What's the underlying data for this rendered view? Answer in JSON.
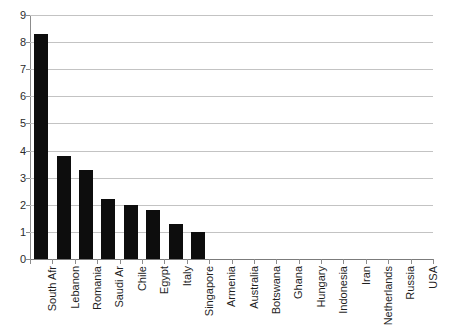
{
  "chart_data": {
    "type": "bar",
    "title": "",
    "subtitle": "",
    "xlabel": "",
    "ylabel": "",
    "ylim": [
      0,
      9
    ],
    "yticks": [
      0,
      1,
      2,
      3,
      4,
      5,
      6,
      7,
      8,
      9
    ],
    "ytick_labels": [
      "0",
      "1",
      "2",
      "3",
      "4",
      "5",
      "6",
      "7",
      "8",
      "9"
    ],
    "grid": true,
    "legend": null,
    "legend_position": "none",
    "bar_color": "#0d0d0d",
    "gridline_color": "#c3c3c3",
    "axis_color": "#8c8c8c",
    "background_color": "#ffffff",
    "categories": [
      "South Afr",
      "Lebanon",
      "Romania",
      "Saudi Ar",
      "Chile",
      "Egypt",
      "Italy",
      "Singapore",
      "Armenia",
      "Australia",
      "Botswana",
      "Ghana",
      "Hungary",
      "Indonesia",
      "Iran",
      "Netherlands",
      "Russia",
      "USA"
    ],
    "values": [
      8.3,
      3.8,
      3.3,
      2.2,
      2.0,
      1.8,
      1.3,
      1.0,
      0,
      0,
      0,
      0,
      0,
      0,
      0,
      0,
      0,
      0
    ]
  }
}
